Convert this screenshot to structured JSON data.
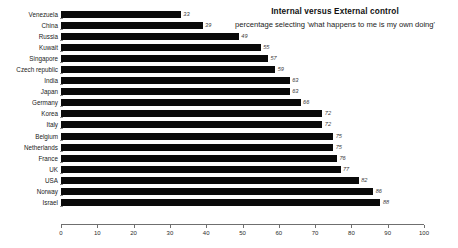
{
  "chart_data": {
    "type": "bar",
    "orientation": "horizontal",
    "title": "Internal versus External control",
    "subtitle": "percentage selecting 'what happens to me is my own doing'",
    "xlabel": "",
    "ylabel": "",
    "xlim": [
      0,
      100
    ],
    "xticks": [
      0,
      10,
      20,
      30,
      40,
      50,
      60,
      70,
      80,
      90,
      100
    ],
    "grid": false,
    "legend": false,
    "bar_color": "#0a0a0a",
    "categories": [
      "Venezuela",
      "China",
      "Russia",
      "Kuwait",
      "Singapore",
      "Czech republic",
      "India",
      "Japan",
      "Germany",
      "Korea",
      "Italy",
      "Belgium",
      "Netherlands",
      "France",
      "UK",
      "USA",
      "Norway",
      "Israel"
    ],
    "values": [
      33,
      39,
      49,
      55,
      57,
      59,
      63,
      63,
      66,
      72,
      72,
      75,
      75,
      76,
      77,
      82,
      86,
      88
    ]
  }
}
